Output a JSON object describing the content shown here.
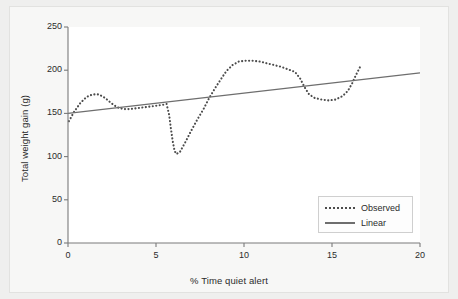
{
  "chart_data": {
    "type": "line",
    "title": "",
    "xlabel": "% Time quiet alert",
    "ylabel": "Total weight gain (g)",
    "xlim": [
      0,
      20
    ],
    "ylim": [
      0,
      250
    ],
    "xticks": [
      0,
      5,
      10,
      15,
      20
    ],
    "xtick_labels": [
      "0",
      "5",
      "10",
      "15",
      "20"
    ],
    "yticks": [
      0,
      50,
      100,
      150,
      200,
      250
    ],
    "ytick_labels": [
      "0",
      "50",
      "100",
      "150",
      "200",
      "250"
    ],
    "grid": false,
    "legend_position": "lower right",
    "series": [
      {
        "name": "Observed",
        "style": "dotted",
        "color": "#4c4c4c",
        "points": [
          [
            0.05,
            141
          ],
          [
            0.35,
            152
          ],
          [
            0.7,
            162
          ],
          [
            1.05,
            169
          ],
          [
            1.4,
            172
          ],
          [
            1.75,
            172
          ],
          [
            2.1,
            168
          ],
          [
            2.45,
            162
          ],
          [
            2.8,
            157
          ],
          [
            3.15,
            155
          ],
          [
            3.5,
            155
          ],
          [
            3.9,
            156
          ],
          [
            4.3,
            157
          ],
          [
            4.7,
            158
          ],
          [
            5.05,
            159
          ],
          [
            5.4,
            160
          ],
          [
            5.6,
            161
          ],
          [
            5.75,
            148
          ],
          [
            5.85,
            132
          ],
          [
            5.95,
            118
          ],
          [
            6.05,
            107
          ],
          [
            6.15,
            103
          ],
          [
            6.35,
            105
          ],
          [
            6.7,
            118
          ],
          [
            7.0,
            130
          ],
          [
            7.35,
            143
          ],
          [
            7.7,
            155
          ],
          [
            8.0,
            167
          ],
          [
            8.35,
            179
          ],
          [
            8.7,
            190
          ],
          [
            9.0,
            199
          ],
          [
            9.35,
            206
          ],
          [
            9.7,
            210
          ],
          [
            10.1,
            211
          ],
          [
            10.5,
            211
          ],
          [
            10.9,
            210
          ],
          [
            11.3,
            208
          ],
          [
            11.7,
            206
          ],
          [
            12.1,
            204
          ],
          [
            12.5,
            201
          ],
          [
            12.9,
            198
          ],
          [
            13.2,
            190
          ],
          [
            13.45,
            180
          ],
          [
            13.7,
            172
          ],
          [
            14.0,
            168
          ],
          [
            14.4,
            166
          ],
          [
            14.8,
            165
          ],
          [
            15.2,
            166
          ],
          [
            15.6,
            170
          ],
          [
            15.9,
            176
          ],
          [
            16.15,
            185
          ],
          [
            16.35,
            194
          ],
          [
            16.5,
            200
          ],
          [
            16.6,
            204
          ]
        ]
      },
      {
        "name": "Linear",
        "style": "solid",
        "color": "#6e6e6e",
        "points": [
          [
            0,
            150
          ],
          [
            20,
            197
          ]
        ]
      }
    ],
    "legend_entries": [
      {
        "label": "Observed",
        "style": "dotted"
      },
      {
        "label": "Linear",
        "style": "solid"
      }
    ]
  },
  "axes": {
    "axis_color": "#7a7a7a",
    "frame_color": "#e2e2e0",
    "plot_background": "#ffffff",
    "figure_background": "#efefee"
  }
}
